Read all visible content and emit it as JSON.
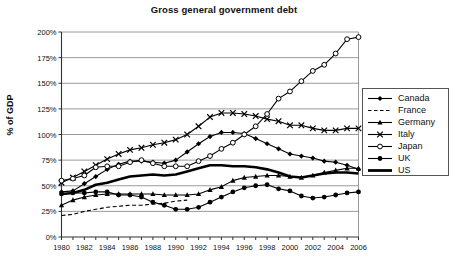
{
  "chart_data": {
    "type": "line",
    "title": "Gross general government debt",
    "xlabel": "",
    "ylabel": "% of GDP",
    "xlim": [
      1980,
      2006
    ],
    "ylim": [
      0,
      200
    ],
    "ytick_step": 25,
    "ytick_labels": [
      "0%",
      "25%",
      "50%",
      "75%",
      "100%",
      "125%",
      "150%",
      "175%",
      "200%"
    ],
    "ytick_values": [
      0,
      25,
      50,
      75,
      100,
      125,
      150,
      175,
      200
    ],
    "xtick_labels": [
      "1980",
      "1982",
      "1984",
      "1986",
      "1988",
      "1990",
      "1992",
      "1994",
      "1996",
      "1998",
      "2000",
      "2002",
      "2004",
      "2006"
    ],
    "xtick_values": [
      1980,
      1982,
      1984,
      1986,
      1988,
      1990,
      1992,
      1994,
      1996,
      1998,
      2000,
      2002,
      2004,
      2006
    ],
    "x": [
      1980,
      1981,
      1982,
      1983,
      1984,
      1985,
      1986,
      1987,
      1988,
      1989,
      1990,
      1991,
      1992,
      1993,
      1994,
      1995,
      1996,
      1997,
      1998,
      1999,
      2000,
      2001,
      2002,
      2003,
      2004,
      2005,
      2006
    ],
    "grid": "horizontal",
    "legend_position": "right",
    "series": [
      {
        "name": "Canada",
        "marker": "diamond",
        "line": "solid",
        "color": "#000000",
        "values": [
          44,
          45,
          52,
          59,
          66,
          71,
          74,
          74,
          73,
          72,
          75,
          83,
          91,
          98,
          102,
          102,
          101,
          96,
          91,
          86,
          81,
          79,
          77,
          74,
          73,
          70,
          66
        ]
      },
      {
        "name": "France",
        "marker": "none",
        "line": "dashed",
        "color": "#000000",
        "values": [
          21,
          22,
          25,
          27,
          29,
          30,
          31,
          31,
          32,
          33,
          35,
          36,
          null,
          null,
          null,
          null,
          null,
          null,
          null,
          null,
          null,
          null,
          null,
          null,
          null,
          null,
          null
        ]
      },
      {
        "name": "Germany",
        "marker": "triangle",
        "line": "solid",
        "color": "#000000",
        "values": [
          31,
          36,
          39,
          41,
          42,
          42,
          42,
          42,
          42,
          41,
          41,
          41,
          42,
          46,
          49,
          55,
          58,
          59,
          60,
          60,
          59,
          58,
          60,
          63,
          65,
          67,
          67
        ]
      },
      {
        "name": "Italy",
        "marker": "cross",
        "line": "solid",
        "color": "#000000",
        "values": [
          53,
          58,
          64,
          70,
          76,
          81,
          85,
          87,
          90,
          92,
          95,
          100,
          108,
          117,
          121,
          121,
          120,
          118,
          115,
          113,
          109,
          109,
          106,
          104,
          104,
          106,
          106
        ]
      },
      {
        "name": "Japan",
        "marker": "open-circle",
        "line": "solid",
        "color": "#000000",
        "values": [
          55,
          57,
          60,
          68,
          69,
          69,
          73,
          75,
          72,
          69,
          69,
          69,
          74,
          79,
          86,
          92,
          100,
          108,
          120,
          135,
          142,
          152,
          162,
          168,
          179,
          193,
          195
        ]
      },
      {
        "name": "UK",
        "marker": "filled-circle",
        "line": "solid",
        "color": "#000000",
        "values": [
          42,
          43,
          43,
          44,
          44,
          41,
          41,
          39,
          34,
          31,
          27,
          27,
          29,
          34,
          39,
          44,
          48,
          50,
          51,
          47,
          45,
          40,
          38,
          39,
          41,
          43,
          44
        ]
      },
      {
        "name": "US",
        "marker": "none",
        "line": "thick",
        "color": "#000000",
        "values": [
          42,
          43,
          46,
          51,
          53,
          56,
          59,
          60,
          61,
          60,
          61,
          64,
          67,
          70,
          70,
          69,
          69,
          68,
          66,
          63,
          59,
          58,
          60,
          62,
          63,
          63,
          62
        ]
      }
    ]
  },
  "legend": {
    "items": [
      {
        "label": "Canada",
        "marker": "diamond-marker-icon"
      },
      {
        "label": "France",
        "marker": "dashed-line-icon"
      },
      {
        "label": "Germany",
        "marker": "triangle-marker-icon"
      },
      {
        "label": "Italy",
        "marker": "cross-marker-icon"
      },
      {
        "label": "Japan",
        "marker": "open-circle-marker-icon"
      },
      {
        "label": "UK",
        "marker": "filled-circle-marker-icon"
      },
      {
        "label": "US",
        "marker": "thick-line-icon"
      }
    ]
  },
  "colors": {
    "ink": "#000000",
    "grid": "#808080",
    "axis": "#444444",
    "background": "#ffffff"
  }
}
